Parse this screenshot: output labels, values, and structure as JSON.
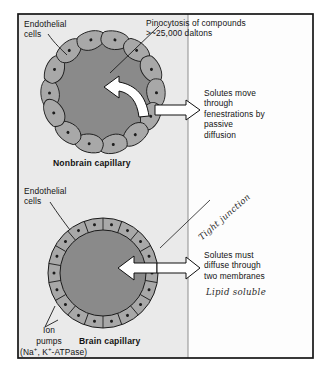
{
  "figure": {
    "panels": [
      {
        "id": "nonbrain",
        "caption": "Nonbrain capillary",
        "labels": {
          "endothelial": "Endothelial\ncells",
          "pinocytosis": "Pinocytosis of compounds\n>~25,000 daltons",
          "solutes": "Solutes move\nthrough\nfenestrations by\npassive\ndiffusion"
        }
      },
      {
        "id": "brain",
        "caption": "Brain capillary",
        "labels": {
          "endothelial": "Endothelial\ncells",
          "ion_pumps_line1": "Ion",
          "ion_pumps_line2": "pumps",
          "ion_pumps_formula_pre": "(Na",
          "ion_pumps_formula_sup1": "+",
          "ion_pumps_formula_mid": ", K",
          "ion_pumps_formula_sup2": "+",
          "ion_pumps_formula_post": "-ATPase)",
          "solutes": "Solutes must\ndiffuse through\ntwo membranes"
        }
      }
    ],
    "annotations": [
      {
        "id": "tight-junction",
        "text": "Tight junction",
        "style": "handwritten",
        "rotated": true
      },
      {
        "id": "lipid-soluble",
        "text": "Lipid soluble",
        "style": "handwritten",
        "rotated": false
      }
    ],
    "colors": {
      "lumen": "#8a8a8a",
      "cell_fill": "#a9a9a9",
      "panel_background": "#ececec",
      "page_background": "#ffffff",
      "frame": "#1a1a1a",
      "arrow_fill": "#ffffff",
      "arrow_stroke": "#101010",
      "text": "#131313"
    }
  }
}
